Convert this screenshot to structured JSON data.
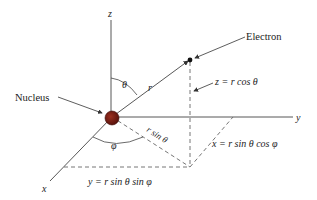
{
  "diagram": {
    "type": "spherical-coordinates",
    "labels": {
      "z_axis": "z",
      "y_axis": "y",
      "x_axis": "x",
      "electron": "Electron",
      "nucleus": "Nucleus",
      "theta": "θ",
      "phi": "φ",
      "r": "r",
      "r_sin_theta": "r sin θ",
      "z_eq": "z = r cos θ",
      "x_eq": "x = r sin θ cos φ",
      "y_eq": "y = r sin θ sin φ"
    },
    "colors": {
      "nucleus": "#6b1a12",
      "lines": "#444444",
      "text": "#222222"
    }
  }
}
